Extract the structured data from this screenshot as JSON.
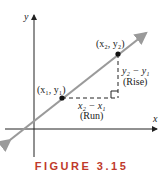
{
  "figure": {
    "caption": "FIGURE 3.15",
    "axes": {
      "x_label": "x",
      "y_label": "y"
    },
    "points": [
      {
        "label": "(x₁, y₁)"
      },
      {
        "label": "(x₂, y₂)"
      }
    ],
    "rise": {
      "expr": "y₂ − y₁",
      "name": "(Rise)"
    },
    "run": {
      "expr": "x₂ − x₁",
      "name": "(Run)"
    },
    "colors": {
      "line": "#9a9a9a",
      "axis": "#222222",
      "caption": "#c0392b"
    }
  }
}
